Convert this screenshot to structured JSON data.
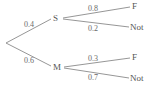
{
  "diagram": {
    "type": "probability-tree",
    "root": {
      "x": 6,
      "y": 43
    },
    "level1": [
      {
        "label": "S",
        "prob": "0.4",
        "x": 56,
        "y": 18
      },
      {
        "label": "M",
        "prob": "0.6",
        "x": 56,
        "y": 67
      }
    ],
    "level2": {
      "S": [
        {
          "label": "F",
          "prob": "0.8"
        },
        {
          "label": "Not",
          "prob": "0.2"
        }
      ],
      "M": [
        {
          "label": "F",
          "prob": "0.3"
        },
        {
          "label": "Not",
          "prob": "0.7"
        }
      ]
    },
    "colors": {
      "line": "#8a8a8a",
      "text": "#555555"
    }
  }
}
